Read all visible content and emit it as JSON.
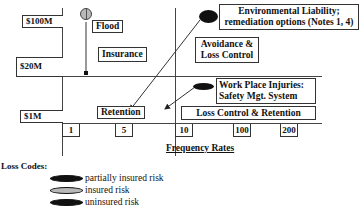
{
  "diagram": {
    "y_axis": {
      "labels": [
        "$100M",
        "$20M",
        "$1M"
      ]
    },
    "x_axis": {
      "title": "Frequency Rates",
      "ticks": [
        "1",
        "5",
        "10",
        "100",
        "200"
      ]
    },
    "regions": {
      "insurance": "Insurance",
      "avoidance_line1": "Avoidance &",
      "avoidance_line2": "Loss Control",
      "retention": "Retention",
      "loss_control_retention": "Loss Control & Retention"
    },
    "risks": {
      "flood": {
        "label": "Flood",
        "code": "insured risk"
      },
      "environmental": {
        "line1": "Environmental Liability;",
        "line2": "remediation options (Notes 1, 4)",
        "code": "uninsured risk"
      },
      "workplace": {
        "line1": "Work Place Injuries:",
        "line2": "Safety Mgt. System",
        "code": "uninsured risk"
      }
    },
    "legend": {
      "title": "Loss Codes:",
      "items": [
        {
          "label": "partially insured risk",
          "color": "#111111"
        },
        {
          "label": "insured risk",
          "color": "#b8b8b8"
        },
        {
          "label": "uninsured risk",
          "color": "#111111"
        }
      ]
    },
    "colors": {
      "line": "#444444",
      "insured_fill": "#b8b8b8",
      "uninsured_fill": "#111111"
    }
  }
}
